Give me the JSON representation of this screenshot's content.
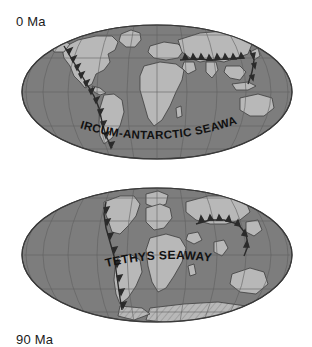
{
  "figure": {
    "projection": "Mollweide",
    "background_color": "#ffffff"
  },
  "colors": {
    "ocean": "#7d7d7d",
    "land": "#b8b8b8",
    "land_hatch": "#9a9a9a",
    "outline": "#3a3a3a",
    "graticule": "#5e5e5e",
    "label_text": "#111111",
    "age_text": "#1a1a1a",
    "teeth": "#2b2b2b"
  },
  "maps": [
    {
      "id": "map-0ma",
      "age_label": "0 Ma",
      "seaway_label": "CIRCUM-ANTARCTIC SEAWAY",
      "seaway_label_position": "south-polar-arc",
      "graticule": {
        "meridian_spacing_deg": 30,
        "parallel_spacing_deg": 30,
        "visible": true
      },
      "features": [
        "North America",
        "South America",
        "Greenland",
        "Eurasia",
        "Africa",
        "Australia",
        "Antarctica",
        "Madagascar",
        "India"
      ],
      "subduction_zones": [
        "eastern Pacific margin (Americas)",
        "Alpine-Himalayan belt",
        "western Pacific arcs"
      ]
    },
    {
      "id": "map-90ma",
      "age_label": "90 Ma",
      "seaway_label": "TETHYS SEAWAY",
      "seaway_label_position": "equatorial-arc",
      "graticule": {
        "meridian_spacing_deg": 30,
        "parallel_spacing_deg": 30,
        "visible": true
      },
      "features": [
        "North America",
        "South America",
        "Greenland",
        "Eurasia",
        "Africa",
        "India",
        "Australia",
        "Antarctica",
        "Madagascar"
      ],
      "subduction_zones": [
        "eastern Pacific margin (Americas)",
        "Tethyan margin",
        "western Pacific arcs"
      ]
    }
  ]
}
